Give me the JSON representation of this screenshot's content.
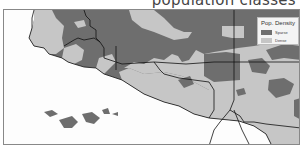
{
  "title": "population classes",
  "legend": {
    "title": "Pop. Density",
    "items": [
      {
        "label": "Sparse",
        "color": "#6e6e6e"
      },
      {
        "label": "Dense",
        "color": "#c6c6c6"
      }
    ]
  },
  "colors": {
    "sparse": "#6e6e6e",
    "dense": "#c6c6c6",
    "sea": "#fdfdfd",
    "border": "#111111"
  }
}
